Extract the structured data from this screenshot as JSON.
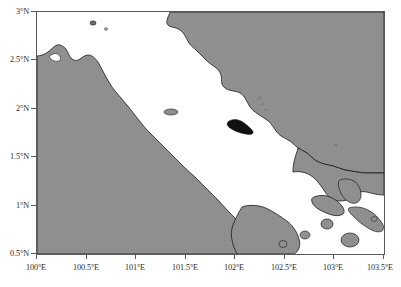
{
  "figure": {
    "kind": "geographic-map",
    "region_description": "Strait of Malacca",
    "projection": "equirectangular",
    "background_color": "#ffffff",
    "land_color": "#8c8c8c",
    "water_color": "#ffffff",
    "coastline_color": "#1a1a1a",
    "frame_color": "#5a5a5a",
    "highlight_island_color": "#111111"
  },
  "axes": {
    "x": {
      "label": "",
      "min": 100.0,
      "max": 103.5,
      "unit": "E",
      "ticks": [
        100.0,
        100.5,
        101.0,
        101.5,
        102.0,
        102.5,
        103.0,
        103.5
      ],
      "tick_labels": [
        "100°E",
        "100.5°E",
        "101°E",
        "101.5°E",
        "102°E",
        "102.5°E",
        "103°E",
        "103.5°E"
      ]
    },
    "y": {
      "label": "",
      "min": 0.5,
      "max": 3.0,
      "unit": "N",
      "ticks": [
        0.5,
        1.0,
        1.5,
        2.0,
        2.5,
        3.0
      ],
      "tick_labels": [
        "0.5°N",
        "1°N",
        "1.5°N",
        "2°N",
        "2.5°N",
        "3°N"
      ]
    }
  },
  "features": [
    {
      "name": "sumatra-landmass",
      "type": "land",
      "side": "southwest"
    },
    {
      "name": "malay-peninsula-landmass",
      "type": "land",
      "side": "northeast"
    },
    {
      "name": "malacca-strait-water",
      "type": "water"
    },
    {
      "name": "singapore-island-cluster",
      "type": "land",
      "side": "southeast"
    },
    {
      "name": "highlighted-island",
      "type": "land-highlight"
    },
    {
      "name": "offshore-islets",
      "type": "land"
    }
  ]
}
